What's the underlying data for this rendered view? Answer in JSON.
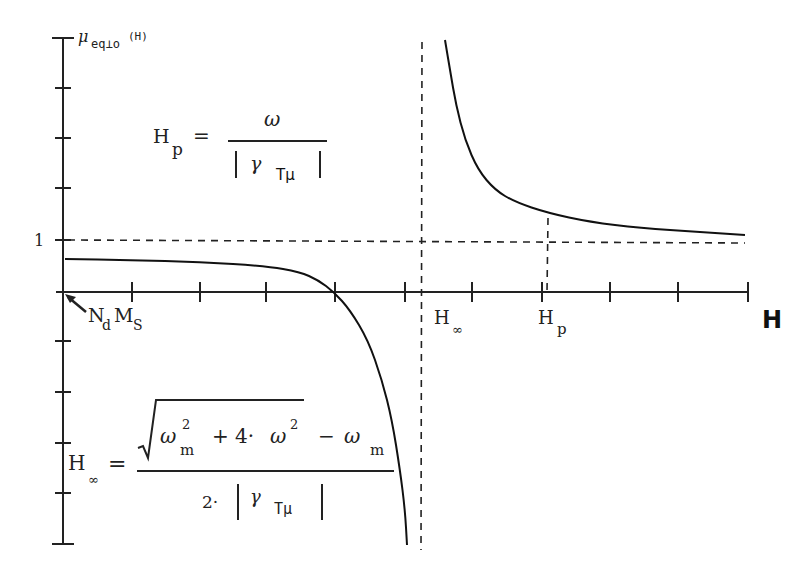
{
  "chart_data": {
    "type": "line",
    "title": "",
    "ylabel": "μ_eq⊥o(H)",
    "xlabel": "H",
    "y_tick_label": "1",
    "x_annotations": [
      "N_d M_S",
      "H_∞",
      "H_p"
    ],
    "legend": [],
    "grid": false,
    "asymptotes": {
      "vertical": "H_∞",
      "horizontal": 1
    },
    "series": [
      {
        "name": "μ_eq⊥o(H), H < H_∞",
        "description": "starts at ~0.6 at H = N_d M_S, decreases slowly, crosses 0, then diverges to -∞ as H → H_∞",
        "pixel_points": [
          [
            65,
            259
          ],
          [
            130,
            260
          ],
          [
            200,
            262
          ],
          [
            266,
            266
          ],
          [
            300,
            272
          ],
          [
            318,
            280
          ],
          [
            334,
            292
          ],
          [
            350,
            310
          ],
          [
            368,
            340
          ],
          [
            382,
            380
          ],
          [
            392,
            420
          ],
          [
            400,
            470
          ],
          [
            405,
            510
          ],
          [
            407,
            545
          ]
        ]
      },
      {
        "name": "μ_eq⊥o(H), H > H_∞",
        "description": "diverges to +∞ just above H_∞, decreases toward 1 as H grows; passes through about 1.5 at H_p",
        "pixel_points": [
          [
            445,
            40
          ],
          [
            450,
            70
          ],
          [
            456,
            105
          ],
          [
            465,
            140
          ],
          [
            478,
            170
          ],
          [
            495,
            190
          ],
          [
            515,
            202
          ],
          [
            548,
            213
          ],
          [
            590,
            222
          ],
          [
            640,
            228
          ],
          [
            700,
            232
          ],
          [
            745,
            235
          ]
        ]
      }
    ],
    "y_axis_ticks_px": [
      38,
      88,
      138,
      188,
      240,
      341,
      392,
      443,
      493,
      544
    ],
    "x_axis_ticks_px": [
      132,
      200,
      266,
      335,
      405,
      472,
      542,
      610,
      678,
      748
    ]
  },
  "labels": {
    "y_axis": {
      "main": "μ",
      "sub": "eq⊥o",
      "arg": "(H)"
    },
    "one": "1",
    "x_axis": "H",
    "nd_ms": {
      "n": "N",
      "n_sub": "d",
      "m": "M",
      "m_sub": "S"
    },
    "h_inf": {
      "h": "H",
      "sub": "∞"
    },
    "h_p": {
      "h": "H",
      "sub": "p"
    }
  },
  "formula_hp": {
    "lhs": "H",
    "lhs_sub": "p",
    "eq": "=",
    "numerator": "ω",
    "den_gamma": "γ",
    "den_sub": "Tμ"
  },
  "formula_hinf": {
    "lhs": "H",
    "lhs_sub": "∞",
    "eq": "=",
    "num_omega1": "ω",
    "num_sub_m1": "m",
    "num_sup2a": "2",
    "num_plus": "+ 4·",
    "num_omega2": "ω",
    "num_sup2b": "2",
    "num_minus": "−",
    "num_omega3": "ω",
    "num_sub_m2": "m",
    "den_two": "2·",
    "den_gamma": "γ",
    "den_sub": "Tμ"
  }
}
